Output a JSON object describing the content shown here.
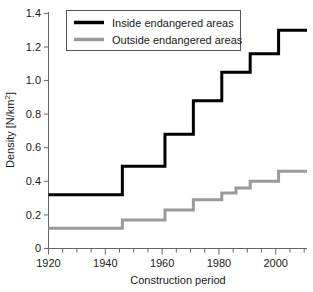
{
  "chart_data": {
    "type": "line",
    "title": "",
    "xlabel": "Construction period",
    "ylabel": "Density [N/km2]",
    "ylabel_display": "Density [N/km²]",
    "xlim": [
      1920,
      2011
    ],
    "ylim": [
      0,
      1.4
    ],
    "grid": false,
    "legend_position": "top-left-inside",
    "x_ticks_major": [
      1920,
      1940,
      1960,
      1980,
      2000
    ],
    "x_tick_labels": [
      "1920",
      "1940",
      "1960",
      "1980",
      "2000"
    ],
    "x_tick_minor_step": 5,
    "y_ticks": [
      0,
      0.2,
      0.4,
      0.6,
      0.8,
      1.0,
      1.2,
      1.4
    ],
    "y_tick_labels": [
      "0",
      "0.2",
      "0.4",
      "0.6",
      "0.8",
      "1.0",
      "1.2",
      "1.4"
    ],
    "step_style": "post",
    "series": [
      {
        "name": "Inside endangered areas",
        "color": "#000000",
        "linewidth": 3,
        "x": [
          1920,
          1946,
          1961,
          1971,
          1981,
          1986,
          1991,
          2001,
          2006,
          2011
        ],
        "values": [
          0.32,
          0.49,
          0.68,
          0.88,
          1.05,
          1.05,
          1.16,
          1.3,
          1.3,
          1.3
        ]
      },
      {
        "name": "Outside endangered areas",
        "color": "#9a9a9a",
        "linewidth": 3,
        "x": [
          1920,
          1946,
          1961,
          1971,
          1981,
          1986,
          1991,
          2001,
          2006,
          2011
        ],
        "values": [
          0.12,
          0.17,
          0.23,
          0.29,
          0.33,
          0.36,
          0.4,
          0.46,
          0.46,
          0.46
        ]
      }
    ]
  },
  "legend": {
    "entries": [
      {
        "label": "Inside endangered areas",
        "color": "#000000"
      },
      {
        "label": "Outside endangered areas",
        "color": "#9a9a9a"
      }
    ]
  },
  "axes": {
    "x_title": "Construction period",
    "y_title_prefix": "Density [N/km",
    "y_title_sup": "2",
    "y_title_suffix": "]"
  }
}
